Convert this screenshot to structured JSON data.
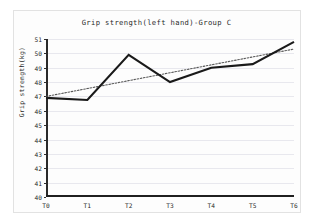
{
  "chart_data": {
    "type": "line",
    "title": "Grip strength(left hand)-Group C",
    "xlabel": "",
    "ylabel": "Grip strength(kg)",
    "categories": [
      "T0",
      "T1",
      "T2",
      "T3",
      "T4",
      "T5",
      "T6"
    ],
    "ylim": [
      40,
      51
    ],
    "xlim": [
      0,
      6
    ],
    "yticks": [
      40,
      41,
      42,
      43,
      44,
      45,
      46,
      47,
      48,
      49,
      50,
      51
    ],
    "ytick_labels": [
      "40",
      "41",
      "42",
      "43",
      "44",
      "45",
      "46",
      "47",
      "48",
      "49",
      "50",
      "51"
    ],
    "grid": true,
    "legend": "none",
    "series": [
      {
        "name": "Grip strength (left hand) - Group C",
        "style": "solid",
        "color": "#1a1a1a",
        "values": [
          46.9,
          46.75,
          49.9,
          48.0,
          49.0,
          49.25,
          50.8
        ]
      },
      {
        "name": "Linear trendline",
        "style": "dotted",
        "color": "#595959",
        "values": [
          47.0,
          47.55,
          48.1,
          48.65,
          49.2,
          49.75,
          50.3
        ]
      }
    ],
    "colors": {
      "data_line": "#1a1a1a",
      "trend_line": "#595959",
      "grid": "#e8e8ee",
      "axis": "#2a2a2a",
      "background": "#fdfdfd",
      "frame": "#e2e2e2"
    }
  }
}
